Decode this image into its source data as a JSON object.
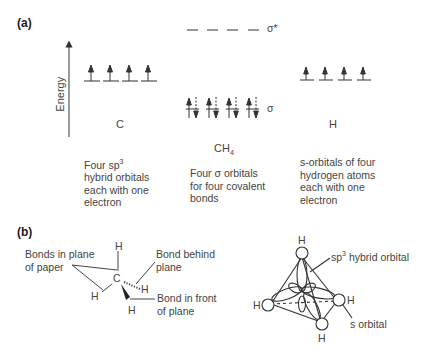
{
  "panel_a": {
    "label": "(a)",
    "axis_label": "Energy",
    "columns": [
      {
        "id": "carbon",
        "title": "C",
        "orbital_count": 4,
        "electrons_per_orbital": 1,
        "caption_lines": [
          "Four sp",
          "hybrid orbitals",
          "each with one",
          "electron"
        ],
        "caption_superscript": "3"
      },
      {
        "id": "methane",
        "title": "CH",
        "title_subscript": "4",
        "bonding_label": "σ",
        "antibonding_label": "σ*",
        "orbital_count": 4,
        "electrons_per_orbital": 2,
        "caption_lines": [
          "Four σ orbitals",
          "for four covalent",
          "bonds"
        ]
      },
      {
        "id": "hydrogen",
        "title": "H",
        "orbital_count": 4,
        "electrons_per_orbital": 1,
        "caption_lines": [
          "s-orbitals of four",
          "hydrogen atoms",
          "each with one",
          "electron"
        ]
      }
    ]
  },
  "panel_b": {
    "label": "(b)",
    "structure": {
      "center_atom": "C",
      "atoms": [
        "H",
        "H",
        "H",
        "H"
      ],
      "annotations": {
        "in_plane": [
          "Bonds in plane",
          "of paper"
        ],
        "behind": [
          "Bond behind",
          "plane"
        ],
        "front": [
          "Bond in front",
          "of plane"
        ]
      }
    },
    "orbital_model": {
      "atoms": [
        "H",
        "H",
        "H",
        "H"
      ],
      "sp3_label": "sp",
      "sp3_superscript": "3",
      "sp3_label_rest": " hybrid orbital",
      "s_label": "s orbital"
    }
  },
  "colors": {
    "line": "#333333",
    "text": "#444444",
    "label": "#1a1a1a"
  }
}
